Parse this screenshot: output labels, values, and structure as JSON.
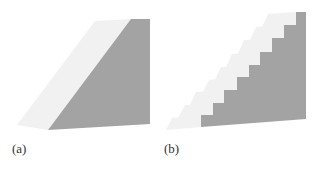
{
  "figures": [
    {
      "id": "a",
      "label": "(a)",
      "shape": "ramp",
      "colors": {
        "top_face": "#f1f1f1",
        "side_face": "#a3a3a3"
      }
    },
    {
      "id": "b",
      "label": "(b)",
      "shape": "staircase",
      "step_count": 9,
      "colors": {
        "top_face": "#f1f1f1",
        "side_face": "#a3a3a3"
      }
    }
  ]
}
